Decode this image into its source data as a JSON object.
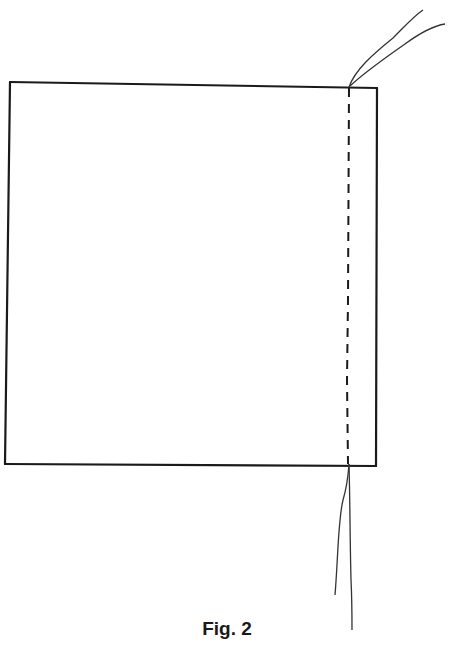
{
  "figure": {
    "caption": "Fig. 2",
    "stroke_color": "#1a1a1a"
  }
}
